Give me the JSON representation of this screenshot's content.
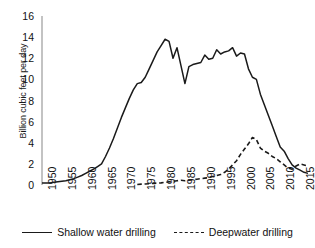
{
  "chart_data": {
    "type": "line",
    "title": "",
    "xlabel": "",
    "ylabel": "Billion cubic feet per day",
    "xlim": [
      1950,
      2017
    ],
    "ylim": [
      0,
      16
    ],
    "ytick_labels": [
      "0",
      "2",
      "4",
      "6",
      "8",
      "10",
      "12",
      "14",
      "16"
    ],
    "ytick_values": [
      0,
      2,
      4,
      6,
      8,
      10,
      12,
      14,
      16
    ],
    "xtick_labels": [
      "1950",
      "1955",
      "1960",
      "1965",
      "1970",
      "1975",
      "1980",
      "1985",
      "1990",
      "1995",
      "2000",
      "2005",
      "2010",
      "2015"
    ],
    "xtick_values": [
      1950,
      1955,
      1960,
      1965,
      1970,
      1975,
      1980,
      1985,
      1990,
      1995,
      2000,
      2005,
      2010,
      2015
    ],
    "grid": false,
    "legend_position": "bottom",
    "line_color": "#1a1a1a",
    "series": [
      {
        "name": "Shallow water drilling",
        "style": "solid",
        "x": [
          1950,
          1951,
          1952,
          1953,
          1954,
          1955,
          1956,
          1957,
          1958,
          1959,
          1960,
          1961,
          1962,
          1963,
          1964,
          1965,
          1966,
          1967,
          1968,
          1969,
          1970,
          1971,
          1972,
          1973,
          1974,
          1975,
          1976,
          1977,
          1978,
          1979,
          1980,
          1981,
          1982,
          1983,
          1984,
          1985,
          1986,
          1987,
          1988,
          1989,
          1990,
          1991,
          1992,
          1993,
          1994,
          1995,
          1996,
          1997,
          1998,
          1999,
          2000,
          2001,
          2002,
          2003,
          2004,
          2005,
          2006,
          2007,
          2008,
          2009,
          2010,
          2011,
          2012,
          2013,
          2014,
          2015,
          2016,
          2017
        ],
        "y": [
          0.2,
          0.2,
          0.2,
          0.25,
          0.3,
          0.35,
          0.4,
          0.5,
          0.6,
          0.75,
          0.9,
          1.1,
          1.3,
          1.5,
          1.75,
          2.0,
          2.7,
          3.5,
          4.4,
          5.4,
          6.4,
          7.3,
          8.2,
          9.0,
          9.6,
          9.7,
          10.2,
          11.0,
          11.8,
          12.6,
          13.2,
          13.8,
          13.6,
          12.0,
          13.0,
          11.3,
          9.6,
          11.2,
          11.4,
          11.5,
          11.6,
          12.3,
          11.9,
          12.0,
          12.8,
          12.4,
          12.6,
          12.7,
          13.0,
          12.2,
          12.5,
          12.4,
          11.0,
          10.2,
          10.0,
          8.6,
          7.6,
          6.6,
          5.6,
          4.6,
          3.6,
          3.2,
          2.5,
          1.9,
          1.6,
          1.4,
          1.2,
          1.1
        ]
      },
      {
        "name": "Deepwater drilling",
        "style": "dashed",
        "x": [
          1974,
          1975,
          1976,
          1977,
          1978,
          1979,
          1980,
          1981,
          1982,
          1983,
          1984,
          1985,
          1986,
          1987,
          1988,
          1989,
          1990,
          1991,
          1992,
          1993,
          1994,
          1995,
          1996,
          1997,
          1998,
          1999,
          2000,
          2001,
          2002,
          2003,
          2004,
          2005,
          2006,
          2007,
          2008,
          2009,
          2010,
          2011,
          2012,
          2013,
          2014,
          2015,
          2016,
          2017
        ],
        "y": [
          0.05,
          0.08,
          0.1,
          0.12,
          0.15,
          0.18,
          0.2,
          0.25,
          0.3,
          0.35,
          0.4,
          0.45,
          0.4,
          0.45,
          0.5,
          0.55,
          0.6,
          0.65,
          0.7,
          0.8,
          0.9,
          1.0,
          1.2,
          1.5,
          1.9,
          2.3,
          2.9,
          3.4,
          3.9,
          4.5,
          4.3,
          3.5,
          3.2,
          3.0,
          2.7,
          2.5,
          2.2,
          1.9,
          1.6,
          1.5,
          1.8,
          2.0,
          1.9,
          1.8
        ]
      }
    ]
  },
  "legend": {
    "items": [
      {
        "label": "Shallow water drilling",
        "style": "solid"
      },
      {
        "label": "Deepwater drilling",
        "style": "dashed"
      }
    ]
  }
}
